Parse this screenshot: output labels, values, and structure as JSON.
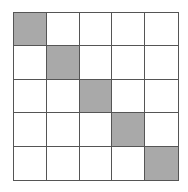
{
  "grid": {
    "rows": 5,
    "cols": 5,
    "fill_color": "#a9a9a9",
    "line_color": "#555555",
    "filled_cells": [
      [
        0,
        0
      ],
      [
        1,
        1
      ],
      [
        2,
        2
      ],
      [
        3,
        3
      ],
      [
        4,
        4
      ]
    ]
  }
}
